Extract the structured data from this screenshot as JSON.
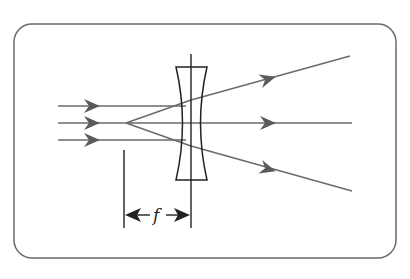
{
  "diagram": {
    "label_focal_length": "f",
    "colors": {
      "frame": "#6a6a6a",
      "rays": "#6a6a6a",
      "lens": "#222222",
      "dimension": "#222222"
    },
    "incoming_rays": 3,
    "outgoing_rays": 3
  }
}
